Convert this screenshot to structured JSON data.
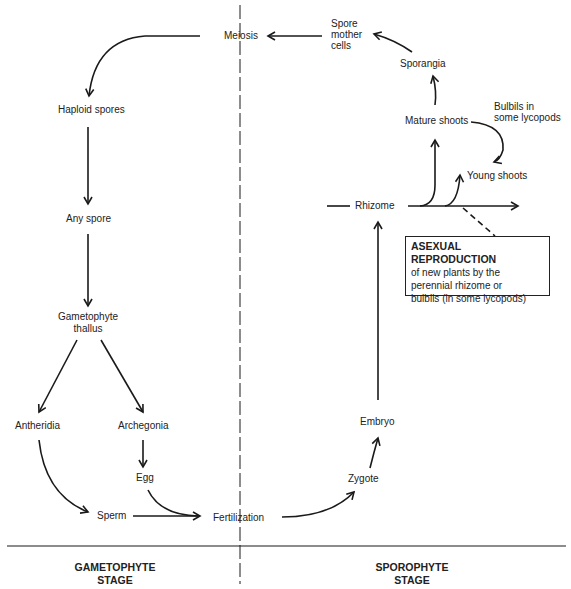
{
  "diagram": {
    "nodes": {
      "meiosis": "Meiosis",
      "spore_mother_cells": [
        "Spore",
        "mother",
        "cells"
      ],
      "sporangia": "Sporangia",
      "mature_shoots": "Mature shoots",
      "bulbils": [
        "Bulbils in",
        "some lycopods"
      ],
      "young_shoots": "Young shoots",
      "rhizome": "Rhizome",
      "haploid_spores": "Haploid spores",
      "any_spore": "Any spore",
      "gametophyte_thallus": [
        "Gametophyte",
        "thallus"
      ],
      "antheridia": "Antheridia",
      "archegonia": "Archegonia",
      "egg": "Egg",
      "sperm": "Sperm",
      "fertilization": "Fertilization",
      "zygote": "Zygote",
      "embryo": "Embryo"
    },
    "asexual_box": {
      "title": "ASEXUAL REPRODUCTION",
      "lines": [
        "of new plants by the",
        "perennial rhizome or",
        "bulbils (in some lycopods)"
      ]
    },
    "stages": {
      "left": [
        "GAMETOPHYTE",
        "STAGE"
      ],
      "right": [
        "SPOROPHYTE",
        "STAGE"
      ]
    },
    "edges": [
      [
        "Spore mother cells",
        "Meiosis"
      ],
      [
        "Sporangia",
        "Spore mother cells"
      ],
      [
        "Mature shoots",
        "Sporangia"
      ],
      [
        "Mature shoots",
        "Young shoots",
        "via bulbils"
      ],
      [
        "Rhizome",
        "Mature shoots"
      ],
      [
        "Rhizome",
        "Young shoots"
      ],
      [
        "Meiosis",
        "Haploid spores"
      ],
      [
        "Haploid spores",
        "Any spore"
      ],
      [
        "Any spore",
        "Gametophyte thallus"
      ],
      [
        "Gametophyte thallus",
        "Antheridia"
      ],
      [
        "Gametophyte thallus",
        "Archegonia"
      ],
      [
        "Archegonia",
        "Egg"
      ],
      [
        "Antheridia",
        "Sperm"
      ],
      [
        "Sperm",
        "Fertilization"
      ],
      [
        "Egg",
        "Fertilization"
      ],
      [
        "Fertilization",
        "Zygote"
      ],
      [
        "Zygote",
        "Embryo"
      ],
      [
        "Embryo",
        "Rhizome"
      ]
    ]
  }
}
